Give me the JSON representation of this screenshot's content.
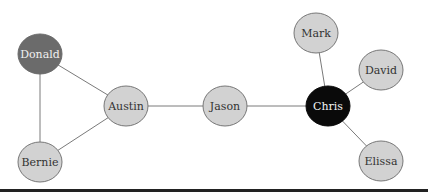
{
  "diagram": {
    "type": "network-graph",
    "colors": {
      "edge": "#7a7a7a",
      "node_default_fill": "#d2d2d2",
      "node_default_stroke": "#777777",
      "node_default_text": "#333333",
      "node_dark_fill": "#6b6b6b",
      "node_dark_text": "#f0f0f0",
      "node_black_fill": "#0a0a0a",
      "node_black_text": "#f5f5f5",
      "baseline": "#222222"
    },
    "nodes": [
      {
        "id": "donald",
        "label": "Donald",
        "cx": 40,
        "cy": 54,
        "style": "dark"
      },
      {
        "id": "austin",
        "label": "Austin",
        "cx": 126,
        "cy": 106,
        "style": "default"
      },
      {
        "id": "bernie",
        "label": "Bernie",
        "cx": 40,
        "cy": 162,
        "style": "default"
      },
      {
        "id": "jason",
        "label": "Jason",
        "cx": 225,
        "cy": 106,
        "style": "default"
      },
      {
        "id": "chris",
        "label": "Chris",
        "cx": 328,
        "cy": 106,
        "style": "black"
      },
      {
        "id": "mark",
        "label": "Mark",
        "cx": 316,
        "cy": 33,
        "style": "default"
      },
      {
        "id": "david",
        "label": "David",
        "cx": 381,
        "cy": 70,
        "style": "default"
      },
      {
        "id": "elissa",
        "label": "Elissa",
        "cx": 381,
        "cy": 161,
        "style": "default"
      }
    ],
    "edges": [
      {
        "from": "donald",
        "to": "austin"
      },
      {
        "from": "donald",
        "to": "bernie"
      },
      {
        "from": "bernie",
        "to": "austin"
      },
      {
        "from": "austin",
        "to": "jason"
      },
      {
        "from": "jason",
        "to": "chris"
      },
      {
        "from": "chris",
        "to": "mark"
      },
      {
        "from": "chris",
        "to": "david"
      },
      {
        "from": "chris",
        "to": "elissa"
      }
    ]
  }
}
